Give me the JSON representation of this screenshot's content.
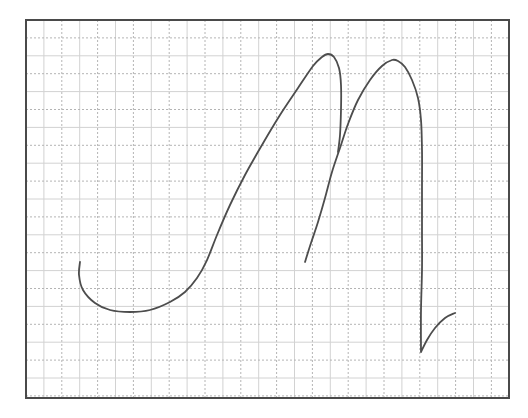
{
  "chart_data": {
    "type": "line",
    "title": "",
    "xlabel": "",
    "ylabel": "",
    "grid": true,
    "grid_style": "alternating solid and dotted lines",
    "legend": null,
    "frame": {
      "left": 26,
      "top": 20,
      "right": 509,
      "bottom": 398
    },
    "grid_pitch_px": 17.9,
    "colors": {
      "trace": "#4d4d4d",
      "frame": "#4a4a4a",
      "grid_solid": "#d2d2d2",
      "grid_dotted": "#b4b4b4"
    },
    "series": [
      {
        "name": "stroke-1",
        "description": "J-shaped curve rising to first peak then falling",
        "points": [
          [
            80,
            262
          ],
          [
            79,
            275
          ],
          [
            83,
            290
          ],
          [
            95,
            303
          ],
          [
            110,
            310
          ],
          [
            130,
            312
          ],
          [
            150,
            310
          ],
          [
            170,
            302
          ],
          [
            185,
            292
          ],
          [
            197,
            278
          ],
          [
            207,
            260
          ],
          [
            217,
            235
          ],
          [
            230,
            205
          ],
          [
            245,
            175
          ],
          [
            262,
            145
          ],
          [
            280,
            115
          ],
          [
            298,
            88
          ],
          [
            313,
            66
          ],
          [
            322,
            57
          ],
          [
            328,
            54
          ],
          [
            334,
            57
          ],
          [
            339,
            68
          ],
          [
            341,
            85
          ],
          [
            341,
            110
          ],
          [
            340,
            135
          ],
          [
            338,
            152
          ]
        ]
      },
      {
        "name": "stroke-2",
        "description": "rising stroke to second peak, vertical drop and small hook",
        "points": [
          [
            305,
            262
          ],
          [
            311,
            243
          ],
          [
            318,
            222
          ],
          [
            325,
            198
          ],
          [
            332,
            172
          ],
          [
            340,
            148
          ],
          [
            348,
            124
          ],
          [
            358,
            100
          ],
          [
            370,
            80
          ],
          [
            382,
            66
          ],
          [
            392,
            60
          ],
          [
            398,
            61
          ],
          [
            405,
            67
          ],
          [
            412,
            80
          ],
          [
            418,
            98
          ],
          [
            421,
            120
          ],
          [
            422,
            150
          ],
          [
            422,
            190
          ],
          [
            422,
            230
          ],
          [
            422,
            270
          ],
          [
            421,
            310
          ],
          [
            421,
            352
          ],
          [
            427,
            340
          ],
          [
            435,
            328
          ],
          [
            445,
            318
          ],
          [
            455,
            313
          ]
        ]
      }
    ]
  }
}
